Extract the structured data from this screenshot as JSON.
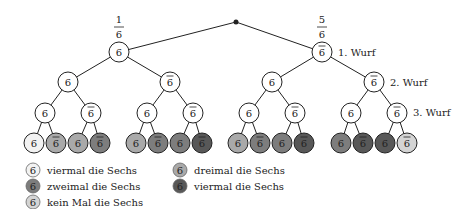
{
  "tree": {
    "root_probabilities": [
      {
        "numerator": "1",
        "denominator": "6"
      },
      {
        "numerator": "5",
        "denominator": "6"
      }
    ],
    "level_labels": [
      "1. Wurf",
      "2. Wurf",
      "3. Wurf"
    ],
    "symbols": {
      "six": "6",
      "not_six": "6"
    },
    "leaf_sixes_count": [
      4,
      3,
      3,
      2,
      3,
      2,
      2,
      1,
      3,
      2,
      2,
      1,
      2,
      1,
      1,
      0
    ]
  },
  "colors": {
    "four": "#f2f2f2",
    "three": "#a9a9a9",
    "two": "#7d7d7d",
    "one": "#585858",
    "zero": "#d4d4d4",
    "inner": "#ffffff"
  },
  "legend": [
    {
      "label": "viermal die Sechs",
      "count": 4
    },
    {
      "label": "zweimal die Sechs",
      "count": 2
    },
    {
      "label": "kein Mal die Sechs",
      "count": 0
    },
    {
      "label": "dreimal die Sechs",
      "count": 3
    },
    {
      "label": "viermal die Sechs",
      "count": 1
    }
  ]
}
